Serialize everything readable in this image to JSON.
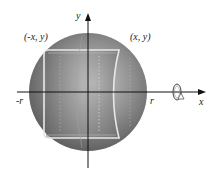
{
  "diagram": {
    "type": "sphere-with-inscribed-cylinder",
    "labels": {
      "y_axis": "y",
      "x_axis": "x",
      "neg_r": "-r",
      "pos_r": "r",
      "left_point": "(-x, y)",
      "right_point": "(x, y)"
    },
    "colors": {
      "sphere_light": "#c8c8c8",
      "sphere_dark": "#5a5a5a",
      "cylinder_edge": "#e8e8e8",
      "axis": "#111111",
      "text": "#222222"
    },
    "icons": {
      "rotation": "rotation-about-x-axis-icon"
    }
  }
}
